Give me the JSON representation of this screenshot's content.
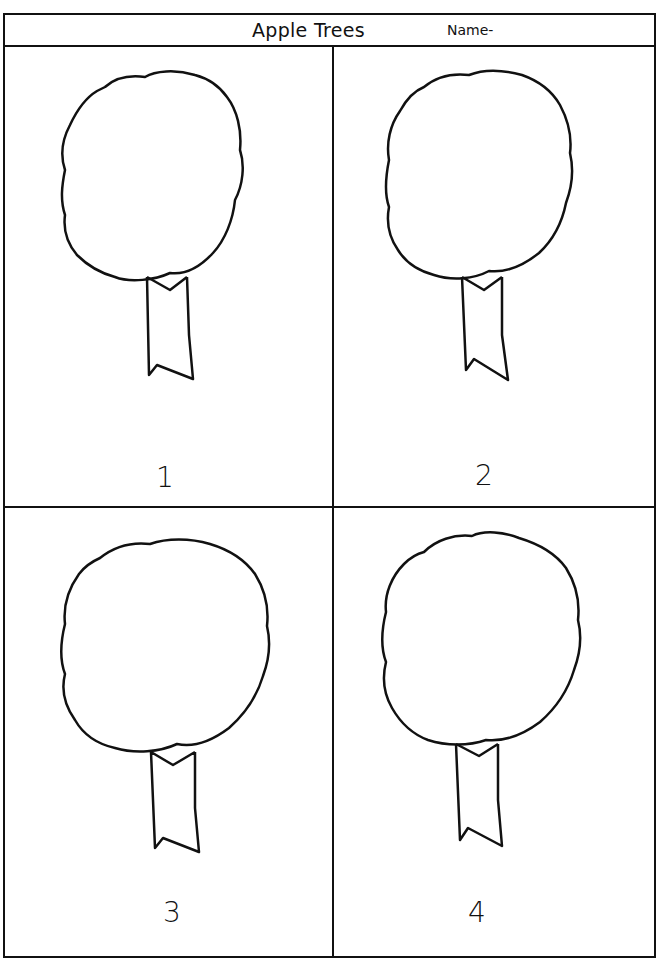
{
  "worksheet": {
    "title": "Apple Trees",
    "name_label": "Name-",
    "panels": [
      {
        "number": "1",
        "icon": "tree-outline-icon"
      },
      {
        "number": "2",
        "icon": "tree-outline-icon"
      },
      {
        "number": "3",
        "icon": "tree-outline-icon"
      },
      {
        "number": "4",
        "icon": "tree-outline-icon"
      }
    ],
    "colors": {
      "line": "#111111",
      "paper": "#ffffff"
    }
  }
}
